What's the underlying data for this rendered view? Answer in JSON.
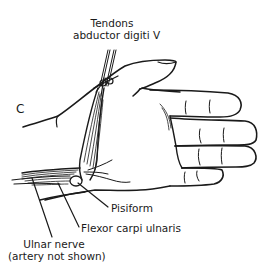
{
  "figure": {
    "panel_letter": "C",
    "line_color": "#1a1a1a",
    "background": "#ffffff"
  },
  "labels": {
    "tendons_line1": "Tendons",
    "tendons_line2": "abductor digiti V",
    "pisiform": "Pisiform",
    "flexor": "Flexor carpi ulnaris",
    "ulnar_line1": "Ulnar nerve",
    "ulnar_line2": "(artery not shown)"
  }
}
